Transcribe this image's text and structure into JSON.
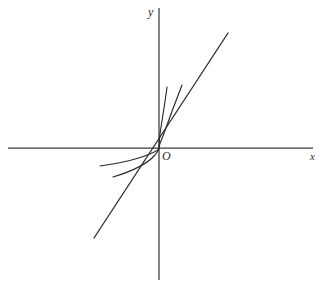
{
  "figure": {
    "kind": "cartesian-axes-curve-sketch",
    "background_color": "#ffffff",
    "ink_color": "#2b2b2b",
    "axis_color": "#3c3c3c",
    "width": 326,
    "height": 288,
    "origin": {
      "x": 159,
      "y": 148
    }
  },
  "labels": {
    "y_axis": "y",
    "x_axis": "x",
    "origin": "O"
  },
  "axes": {
    "x_axis": {
      "name": "x-axis",
      "x1": 8,
      "y1": 148,
      "x2": 313,
      "y2": 148
    },
    "y_axis": {
      "name": "y-axis",
      "x1": 159,
      "y1": 8,
      "x2": 159,
      "y2": 280
    }
  },
  "chart_data": {
    "type": "line",
    "title": "",
    "xlabel": "x",
    "ylabel": "y",
    "grid": false,
    "legend": "none",
    "origin_label": "O",
    "series": [
      {
        "name": "straight-line",
        "kind": "straight",
        "path": "M 94 238 L 228 33",
        "points": [
          [
            94,
            238
          ],
          [
            159,
            148
          ],
          [
            228,
            33
          ]
        ]
      },
      {
        "name": "curve-outer",
        "kind": "cube-root-like",
        "path": "M 113 177 C 133 171, 148 163, 155 155 C 158 151, 159 149, 159 148 C 159 147, 160 143, 163 136 C 168 122, 175 103, 182 85",
        "points": [
          [
            113,
            177
          ],
          [
            148,
            163
          ],
          [
            159,
            148
          ],
          [
            168,
            122
          ],
          [
            182,
            85
          ]
        ]
      },
      {
        "name": "curve-inner",
        "kind": "cube-root-like",
        "path": "M 100 166 C 122 163, 141 158, 152 153 C 157 151, 159 149, 159 148 C 159 146, 159 142, 160 134 C 162 120, 165 103, 167 87",
        "points": [
          [
            100,
            166
          ],
          [
            141,
            158
          ],
          [
            159,
            148
          ],
          [
            162,
            120
          ],
          [
            167,
            87
          ]
        ]
      }
    ]
  }
}
